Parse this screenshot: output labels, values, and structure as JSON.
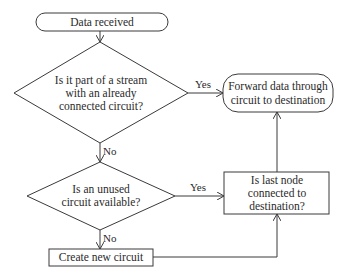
{
  "diagram": {
    "type": "flowchart",
    "colors": {
      "stroke": "#3a3a3a",
      "fill": "#ffffff",
      "text": "#2a2a2a",
      "background": "#ffffff"
    },
    "nodes": {
      "start": {
        "shape": "terminal",
        "label": "Data received"
      },
      "decision_stream": {
        "shape": "decision",
        "lines": [
          "Is it part of a stream",
          "with an already",
          "connected circuit?"
        ]
      },
      "forward": {
        "shape": "terminal",
        "lines": [
          "Forward data through",
          "circuit to destination"
        ]
      },
      "decision_unused": {
        "shape": "decision",
        "lines": [
          "Is an unused",
          "circuit available?"
        ]
      },
      "last_node": {
        "shape": "process",
        "lines": [
          "Is last node",
          "connected to",
          "destination?"
        ]
      },
      "create": {
        "shape": "process",
        "label": "Create new circuit"
      }
    },
    "edges": {
      "start_to_stream": {
        "label": ""
      },
      "stream_yes": {
        "label": "Yes"
      },
      "stream_no": {
        "label": "No"
      },
      "unused_yes": {
        "label": "Yes"
      },
      "unused_no": {
        "label": "No"
      },
      "create_to_last": {
        "label": ""
      },
      "last_to_forward": {
        "label": ""
      }
    }
  }
}
